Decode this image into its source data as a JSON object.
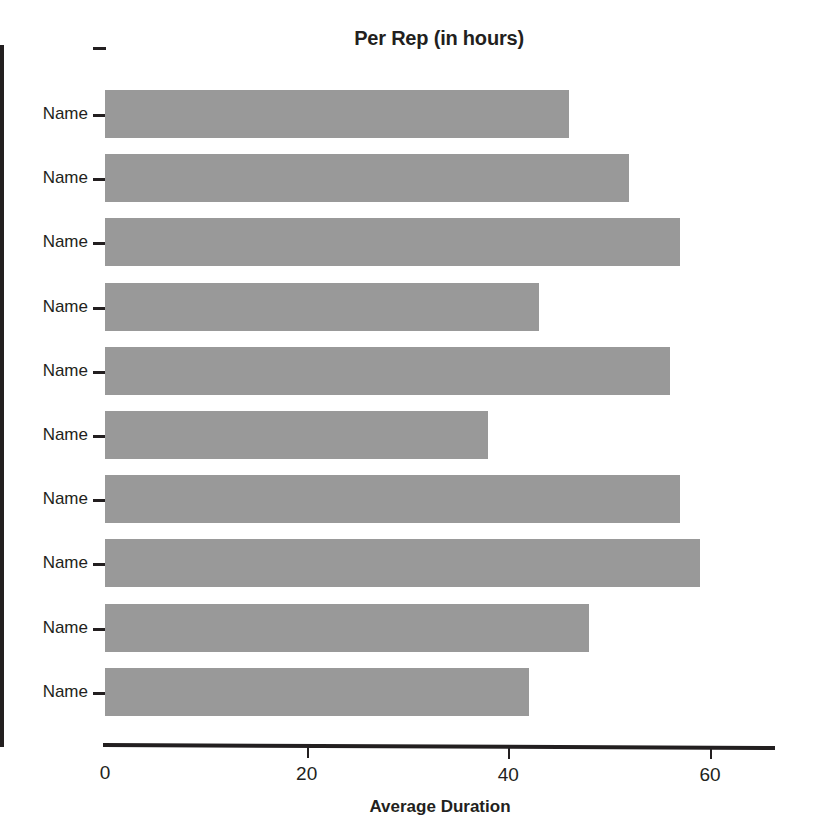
{
  "chart_data": {
    "type": "bar",
    "orientation": "horizontal",
    "title": "Per Rep (in hours)",
    "xlabel": "Average Duration",
    "ylabel": "",
    "categories": [
      "Name",
      "Name",
      "Name",
      "Name",
      "Name",
      "Name",
      "Name",
      "Name",
      "Name",
      "Name"
    ],
    "values": [
      46,
      52,
      57,
      43,
      56,
      38,
      57,
      59,
      48,
      42
    ],
    "xticks": [
      0,
      20,
      40,
      60
    ],
    "xtick_labels": [
      "0",
      "20",
      "40",
      "60"
    ],
    "xlim": [
      0,
      66.5
    ],
    "grid": false,
    "legend": false,
    "bar_color": "#999999",
    "axis_color": "#231f20",
    "background": "#ffffff"
  }
}
